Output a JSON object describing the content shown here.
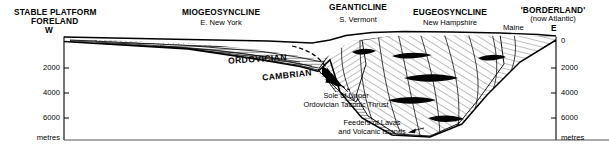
{
  "figure": {
    "type": "geological-cross-section",
    "title_regions": [
      {
        "id": "stable-platform",
        "line1": "STABLE PLATFORM",
        "line2": "FORELAND",
        "direction": "W"
      },
      {
        "id": "miogeosyncline",
        "line1": "MIOGEOSYNCLINE",
        "line2": "E. New York"
      },
      {
        "id": "geanticline",
        "line1": "GEANTICLINE",
        "line2": "S. Vermont"
      },
      {
        "id": "eugeosyncline",
        "line1": "EUGEOSYNCLINE",
        "line2": "New Hampshire"
      },
      {
        "id": "borderland",
        "line1": "'BORDERLAND'",
        "line2": "(now Atlantic)",
        "direction": "E",
        "locality": "Maine"
      }
    ],
    "strata_labels": [
      {
        "id": "ordovician",
        "text": "ORDOVICIAN"
      },
      {
        "id": "cambrian",
        "text": "CAMBRIAN"
      }
    ],
    "annotations": [
      {
        "id": "taconic-thrust",
        "line1": "Sole of Upper",
        "line2": "Ordovician Taconic Thrust"
      },
      {
        "id": "lava-feeders",
        "line1": "Feeders of Lavas",
        "line2": "and Volcanic Islands"
      }
    ],
    "axes": {
      "left": {
        "unit": "metres",
        "ticks": [
          "2000",
          "4000",
          "6000"
        ]
      },
      "right": {
        "unit": "metres",
        "ticks": [
          "0",
          "2000",
          "4000",
          "6000"
        ]
      }
    },
    "colors": {
      "ink": "#000000",
      "background": "#ffffff",
      "hatch": "#2b2b2b"
    }
  }
}
